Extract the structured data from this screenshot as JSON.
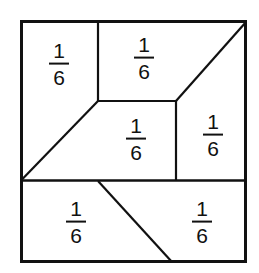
{
  "figure": {
    "shape": "square",
    "total_parts": 6,
    "stroke_color": "#111111",
    "fill_color": "#ffffff",
    "outer_border_width": 3,
    "inner_line_width": 2,
    "square": {
      "x0": 20,
      "y0": 20,
      "x1": 247,
      "y1": 263
    },
    "lines": [
      {
        "name": "top-vertical-divider",
        "x1": 98,
        "y1": 20,
        "x2": 98,
        "y2": 101
      },
      {
        "name": "center-horizontal-divider",
        "x1": 98,
        "y1": 101,
        "x2": 176,
        "y2": 101
      },
      {
        "name": "right-vertical-divider",
        "x1": 176,
        "y1": 101,
        "x2": 176,
        "y2": 180
      },
      {
        "name": "lower-full-horizontal-divider",
        "x1": 20,
        "y1": 180,
        "x2": 247,
        "y2": 180
      },
      {
        "name": "left-diagonal",
        "x1": 20,
        "y1": 180,
        "x2": 98,
        "y2": 101
      },
      {
        "name": "top-right-diagonal",
        "x1": 176,
        "y1": 101,
        "x2": 247,
        "y2": 21
      },
      {
        "name": "bottom-diagonal",
        "x1": 98,
        "y1": 181,
        "x2": 172,
        "y2": 263
      }
    ],
    "regions": [
      {
        "id": "top-left",
        "numerator": "1",
        "denominator": "6",
        "cx": 59,
        "cy": 64
      },
      {
        "id": "top-middle",
        "numerator": "1",
        "denominator": "6",
        "cx": 144,
        "cy": 58
      },
      {
        "id": "right",
        "numerator": "1",
        "denominator": "6",
        "cx": 213,
        "cy": 135
      },
      {
        "id": "center",
        "numerator": "1",
        "denominator": "6",
        "cx": 136,
        "cy": 139
      },
      {
        "id": "bottom-left",
        "numerator": "1",
        "denominator": "6",
        "cx": 76,
        "cy": 222
      },
      {
        "id": "bottom-right",
        "numerator": "1",
        "denominator": "6",
        "cx": 202,
        "cy": 222
      }
    ]
  }
}
